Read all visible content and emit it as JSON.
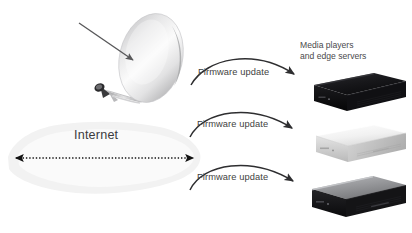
{
  "diagram": {
    "background_color": "#ffffff",
    "width": 412,
    "height": 233
  },
  "sources": {
    "satellite": {
      "name": "satellite-dish",
      "label": "",
      "dish_color_light": "#fdfdfd",
      "dish_color_dark": "#9d9d9f",
      "inbound_arrow": {
        "name": "satellite-signal-arrow",
        "color": "#58585a"
      }
    },
    "internet": {
      "name": "internet-cloud",
      "label": "Internet",
      "cloud_color": "#f3f3f3",
      "arrow": {
        "name": "internet-bidirectional-arrow",
        "color": "#1a1a1a",
        "style": "dotted-double-headed"
      }
    }
  },
  "flows": [
    {
      "label": "Firmware update",
      "from": "satellite",
      "to": "device-1"
    },
    {
      "label": "Firmware update",
      "from": "internet",
      "to": "device-2"
    },
    {
      "label": "Firmware update",
      "from": "internet",
      "to": "device-3"
    }
  ],
  "targets": {
    "heading_line1": "Media players",
    "heading_line2": "and edge servers",
    "devices": [
      {
        "name": "media-player-black",
        "color": "#111113",
        "top_color": "#17171a",
        "accent": "#3a3a3e"
      },
      {
        "name": "media-player-white",
        "color": "#d8d8d8",
        "top_color": "#f4f4f4",
        "accent": "#b4b4b4"
      },
      {
        "name": "media-player-silver-black",
        "color": "#1a1a1c",
        "top_color": "#8f9093",
        "accent": "#4a4a4e"
      }
    ]
  },
  "colors": {
    "arrow_stroke": "#2e2e30",
    "text": "#4a4a4c"
  }
}
